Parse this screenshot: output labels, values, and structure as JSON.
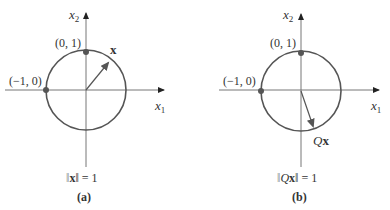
{
  "colors": {
    "circle": "#555555",
    "axis": "#777777",
    "vector": "#555555",
    "point": "#555555",
    "text": "#333333"
  },
  "panels": [
    {
      "id": "a",
      "caption": "(a)",
      "axis_x_label": "x",
      "axis_x_sub": "1",
      "axis_y_label": "x",
      "axis_y_sub": "2",
      "point_top_label": "(0, 1)",
      "point_left_label": "(−1, 0)",
      "vector_label": "x",
      "norm_prefix": "‖",
      "norm_vec": "x",
      "norm_suffix": "‖ = 1"
    },
    {
      "id": "b",
      "caption": "(b)",
      "axis_x_label": "x",
      "axis_x_sub": "1",
      "axis_y_label": "x",
      "axis_y_sub": "2",
      "point_top_label": "(0, 1)",
      "point_left_label": "(−1, 0)",
      "vector_label_Q": "Q",
      "vector_label": "x",
      "norm_prefix": "‖",
      "norm_Q": "Q",
      "norm_vec": "x",
      "norm_suffix": "‖ = 1"
    }
  ]
}
